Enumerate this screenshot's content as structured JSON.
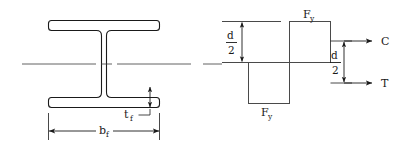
{
  "figure": {
    "stroke_color": "#1a1a1a",
    "block_stroke_color": "#4a4a4a",
    "background": "#ffffff"
  },
  "section_view": {
    "name": "I-beam cross section",
    "dimensions": [
      {
        "id": "bf",
        "symbol": "b",
        "subscript": "f",
        "meaning": "flange width",
        "orientation": "horizontal"
      },
      {
        "id": "tf",
        "symbol": "t",
        "subscript": "f",
        "meaning": "flange thickness",
        "orientation": "vertical"
      }
    ],
    "centerline_label": ""
  },
  "stress_diagram": {
    "name": "plastic stress block",
    "stress_labels": [
      {
        "id": "fy-top",
        "symbol": "F",
        "subscript": "y",
        "position": "top"
      },
      {
        "id": "fy-bottom",
        "symbol": "F",
        "subscript": "y",
        "position": "bottom"
      }
    ],
    "depth_dimensions": [
      {
        "id": "d2-left",
        "numerator": "d",
        "denominator": "2",
        "meaning": "half depth above neutral axis",
        "side": "left"
      },
      {
        "id": "d2-right",
        "numerator": "d",
        "denominator": "2",
        "meaning": "lever arm between resultants",
        "side": "right"
      }
    ],
    "force_labels": [
      {
        "id": "force-c",
        "label": "C",
        "meaning": "compression resultant"
      },
      {
        "id": "force-t",
        "label": "T",
        "meaning": "tension resultant"
      }
    ]
  }
}
